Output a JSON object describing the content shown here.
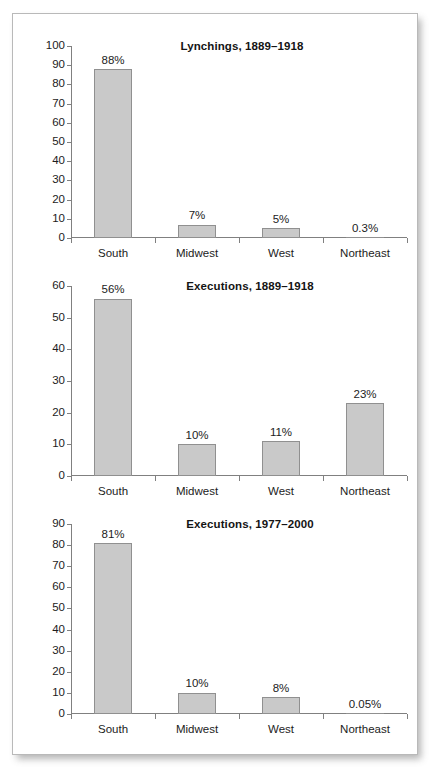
{
  "figure": {
    "background_color": "#ffffff",
    "card_border_color": "#b9b9b9",
    "bar_fill_color": "#c9c9c9",
    "bar_edge_color": "#909090",
    "axis_color": "#808080",
    "text_color": "#1c1c1c"
  },
  "chart_data": [
    {
      "type": "bar",
      "title": "Lynchings, 1889–1918",
      "xlabel": "",
      "ylabel": "",
      "ylim": [
        0,
        100
      ],
      "ytick_step": 10,
      "yticks": [
        0,
        10,
        20,
        30,
        40,
        50,
        60,
        70,
        80,
        90,
        100
      ],
      "grid": false,
      "legend": "none",
      "categories": [
        "South",
        "Midwest",
        "West",
        "Northeast"
      ],
      "values": [
        88,
        7,
        5,
        0.3
      ],
      "data_labels": [
        "88%",
        "7%",
        "5%",
        "0.3%"
      ]
    },
    {
      "type": "bar",
      "title": "Executions, 1889–1918",
      "xlabel": "",
      "ylabel": "",
      "ylim": [
        0,
        60
      ],
      "ytick_step": 10,
      "yticks": [
        0,
        10,
        20,
        30,
        40,
        50,
        60
      ],
      "grid": false,
      "legend": "none",
      "categories": [
        "South",
        "Midwest",
        "West",
        "Northeast"
      ],
      "values": [
        56,
        10,
        11,
        23
      ],
      "data_labels": [
        "56%",
        "10%",
        "11%",
        "23%"
      ]
    },
    {
      "type": "bar",
      "title": "Executions, 1977–2000",
      "xlabel": "",
      "ylabel": "",
      "ylim": [
        0,
        90
      ],
      "ytick_step": 10,
      "yticks": [
        0,
        10,
        20,
        30,
        40,
        50,
        60,
        70,
        80,
        90
      ],
      "grid": false,
      "legend": "none",
      "categories": [
        "South",
        "Midwest",
        "West",
        "Northeast"
      ],
      "values": [
        81,
        10,
        8,
        0.05
      ],
      "data_labels": [
        "81%",
        "10%",
        "8%",
        "0.05%"
      ]
    }
  ]
}
